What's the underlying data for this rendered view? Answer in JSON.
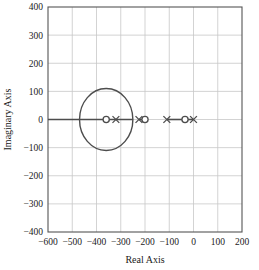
{
  "chart_data": {
    "type": "scatter",
    "title": "",
    "xlabel": "Real Axis",
    "ylabel": "Imaginary Axis",
    "xlim": [
      -600,
      200
    ],
    "ylim": [
      -400,
      400
    ],
    "grid": true,
    "legend": null,
    "xticks": [
      -600,
      -500,
      -400,
      -300,
      -200,
      -100,
      0,
      100,
      200
    ],
    "yticks": [
      400,
      300,
      200,
      100,
      0,
      -100,
      -200,
      -300,
      -400
    ],
    "xtick_labels": [
      "-600",
      "-500",
      "-400",
      "-300",
      "-200",
      "-100",
      "0",
      "100",
      "200"
    ],
    "ytick_labels": [
      "400",
      "300",
      "200",
      "100",
      "0",
      "-100",
      "-200",
      "-300",
      "-400"
    ],
    "series": [
      {
        "name": "poles",
        "marker": "x",
        "color": "#4d4d4d",
        "points": [
          {
            "x": -320,
            "y": 0
          },
          {
            "x": -225,
            "y": 0
          },
          {
            "x": -110,
            "y": 0
          },
          {
            "x": 0,
            "y": 0
          }
        ]
      },
      {
        "name": "zeros",
        "marker": "o",
        "color": "#4d4d4d",
        "points": [
          {
            "x": -360,
            "y": 0
          },
          {
            "x": -200,
            "y": 0
          },
          {
            "x": -35,
            "y": 0
          }
        ]
      }
    ],
    "locus_circle": {
      "center_x": -360,
      "center_y": 0,
      "radius": 110,
      "color": "#4d4d4d"
    },
    "locus_segments": [
      {
        "x0": -600,
        "x1": -250,
        "y": 0
      },
      {
        "x0": -225,
        "x1": -200,
        "y": 0
      },
      {
        "x0": -110,
        "x1": -35,
        "y": 0
      },
      {
        "x0": -35,
        "x1": 0,
        "y": 0
      }
    ]
  },
  "axes": {
    "xlabel": "Real Axis",
    "ylabel": "Imaginary Axis"
  }
}
